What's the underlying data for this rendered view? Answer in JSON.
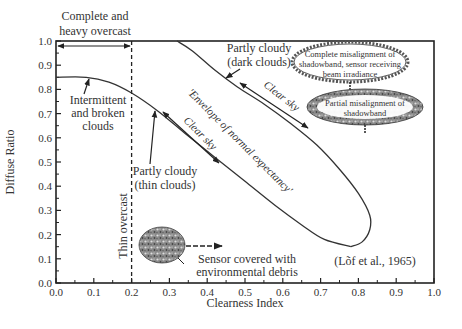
{
  "chart_data": {
    "type": "line",
    "title": "",
    "xlabel": "Clearness Index",
    "ylabel": "Diffuse Ratio",
    "xlim": [
      0.0,
      1.0
    ],
    "ylim": [
      0.0,
      1.0
    ],
    "x_ticks": [
      "0.0",
      "0.1",
      "0.2",
      "0.3",
      "0.4",
      "0.5",
      "0.6",
      "0.7",
      "0.8",
      "0.9",
      "1.0"
    ],
    "y_ticks": [
      "0.0",
      "0.1",
      "0.2",
      "0.3",
      "0.4",
      "0.5",
      "0.6",
      "0.7",
      "0.8",
      "0.9",
      "1.0"
    ],
    "grid": false,
    "series": [
      {
        "name": "Envelope upper boundary",
        "points": [
          [
            0.32,
            1.0
          ],
          [
            0.36,
            0.96
          ],
          [
            0.42,
            0.88
          ],
          [
            0.48,
            0.81
          ],
          [
            0.55,
            0.74
          ],
          [
            0.62,
            0.66
          ],
          [
            0.69,
            0.57
          ],
          [
            0.75,
            0.47
          ],
          [
            0.8,
            0.37
          ],
          [
            0.83,
            0.28
          ],
          [
            0.83,
            0.22
          ],
          [
            0.81,
            0.17
          ],
          [
            0.78,
            0.15
          ]
        ]
      },
      {
        "name": "Envelope lower boundary",
        "points": [
          [
            0.0,
            0.85
          ],
          [
            0.08,
            0.85
          ],
          [
            0.14,
            0.83
          ],
          [
            0.2,
            0.785
          ],
          [
            0.27,
            0.71
          ],
          [
            0.34,
            0.62
          ],
          [
            0.42,
            0.52
          ],
          [
            0.5,
            0.42
          ],
          [
            0.58,
            0.32
          ],
          [
            0.65,
            0.24
          ],
          [
            0.71,
            0.18
          ],
          [
            0.78,
            0.15
          ]
        ]
      }
    ],
    "vertical_line": {
      "x": 0.2,
      "style": "dashed",
      "label": "Thin overcast"
    },
    "annotations": [
      {
        "id": "overcast",
        "text": [
          "Complete and",
          "heavy overcast"
        ]
      },
      {
        "id": "intermittent",
        "text": [
          "Intermittent",
          "and broken",
          "clouds"
        ]
      },
      {
        "id": "partly_thin",
        "text": [
          "Partly cloudy",
          "(thin clouds)"
        ]
      },
      {
        "id": "partly_dark",
        "text": [
          "Partly cloudy",
          "(dark clouds)"
        ]
      },
      {
        "id": "envelope",
        "text": "'Envelope of normal expectancy'"
      },
      {
        "id": "clear1",
        "text": "Clear sky"
      },
      {
        "id": "clear2",
        "text": "Clear sky"
      },
      {
        "id": "complete_misalign",
        "text": [
          "Complete misalignment of",
          "shadowband, sensor receiving",
          "beam irradiance"
        ]
      },
      {
        "id": "partial_misalign",
        "text": [
          "Partial misalignment of",
          "shadowband"
        ]
      },
      {
        "id": "debris",
        "text": [
          "Sensor covered with",
          "environmental debris"
        ]
      },
      {
        "id": "citation",
        "text": "(Lõf et al., 1965)"
      }
    ]
  }
}
